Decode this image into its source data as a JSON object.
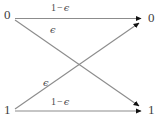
{
  "figure": {
    "type": "binary-symmetric-channel-diagram",
    "width": 160,
    "height": 123,
    "background_color": "#ffffff",
    "line_color": "#8c8c8c",
    "arrowhead_color": "#111111",
    "text_color": "#3d3d3d"
  },
  "nodes": {
    "input": [
      {
        "id": "in-0",
        "label": "0",
        "x": 15,
        "y": 18
      },
      {
        "id": "in-1",
        "label": "1",
        "x": 15,
        "y": 111
      }
    ],
    "output": [
      {
        "id": "out-0",
        "label": "0",
        "x": 147,
        "y": 18
      },
      {
        "id": "out-1",
        "label": "1",
        "x": 147,
        "y": 111
      }
    ]
  },
  "edges": [
    {
      "id": "edge-0-0",
      "from": "in-0",
      "to": "out-0",
      "label_one": "1",
      "label_minus": "−",
      "label_eps": "ϵ",
      "label_text": "1 − ϵ"
    },
    {
      "id": "edge-0-1",
      "from": "in-0",
      "to": "out-1",
      "label_eps": "ϵ",
      "label_text": "ϵ"
    },
    {
      "id": "edge-1-0",
      "from": "in-1",
      "to": "out-0",
      "label_eps": "ϵ",
      "label_text": "ϵ"
    },
    {
      "id": "edge-1-1",
      "from": "in-1",
      "to": "out-1",
      "label_one": "1",
      "label_minus": "−",
      "label_eps": "ϵ",
      "label_text": "1 − ϵ"
    }
  ]
}
